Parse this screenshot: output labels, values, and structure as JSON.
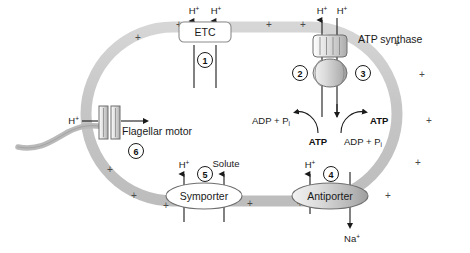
{
  "diagram": {
    "colors": {
      "membrane": "#c9c9c9",
      "membrane_edge": "#b3b3b3",
      "line": "#1a1a1a",
      "plus": "#4a4a4a",
      "protein_fill": "#d9d9d9",
      "white": "#ffffff"
    },
    "membrane_charge_symbol": "+",
    "membrane_charges": [
      {
        "x": 135,
        "y": 37
      },
      {
        "x": 175,
        "y": 24
      },
      {
        "x": 264,
        "y": 24
      },
      {
        "x": 298,
        "y": 24
      },
      {
        "x": 392,
        "y": 42
      },
      {
        "x": 416,
        "y": 73
      },
      {
        "x": 424,
        "y": 120
      },
      {
        "x": 413,
        "y": 162
      },
      {
        "x": 383,
        "y": 196
      },
      {
        "x": 296,
        "y": 203
      },
      {
        "x": 245,
        "y": 203
      },
      {
        "x": 162,
        "y": 205
      },
      {
        "x": 130,
        "y": 196
      },
      {
        "x": 106,
        "y": 170
      },
      {
        "x": 100,
        "y": 120
      }
    ],
    "components": [
      {
        "id": "etc",
        "name": "ETC",
        "label": "ETC",
        "number": "1",
        "shape": "rounded-rect"
      },
      {
        "id": "atp-synthase",
        "name": "ATP synthase",
        "label": "ATP synthase",
        "numbers": [
          "2",
          "3"
        ],
        "shape": "barrel-and-head"
      },
      {
        "id": "antiporter",
        "name": "Antiporter",
        "label": "Antiporter",
        "number": "4",
        "shape": "ellipse"
      },
      {
        "id": "symporter",
        "name": "Symporter",
        "label": "Symporter",
        "number": "5",
        "shape": "ellipse"
      },
      {
        "id": "flagellar-motor",
        "name": "Flagellar motor",
        "label": "Flagellar motor",
        "number": "6",
        "shape": "rect-rotor"
      }
    ],
    "species": {
      "proton": "H",
      "proton_charge": "+",
      "sodium": "Na",
      "sodium_charge": "+",
      "solute": "Solute",
      "atp": "ATP",
      "adp": "ADP + P",
      "adp_sub": "i"
    },
    "labels": {
      "etc_proton_left": "H",
      "etc_proton_right": "H",
      "synthase_proton_left": "H",
      "synthase_proton_right": "H",
      "atp_synthase_name": "ATP synthase",
      "flagellar_motor_name": "Flagellar motor",
      "flagellar_proton": "H",
      "symporter_name": "Symporter",
      "symporter_proton": "H",
      "symporter_solute": "Solute",
      "antiporter_name": "Antiporter",
      "antiporter_proton": "H",
      "antiporter_sodium": "Na",
      "left_adp": "ADP + P",
      "left_atp": "ATP",
      "right_atp": "ATP",
      "right_adp": "ADP + P"
    },
    "numbers": {
      "n1": "1",
      "n2": "2",
      "n3": "3",
      "n4": "4",
      "n5": "5",
      "n6": "6"
    }
  }
}
